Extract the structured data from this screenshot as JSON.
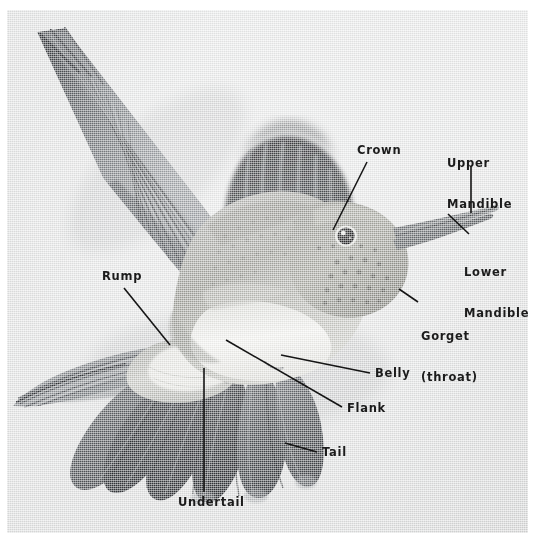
{
  "figure": {
    "kind": "annotated-photograph",
    "rendering": "black-and-white photograph",
    "plate": {
      "x": 7,
      "y": 10,
      "width": 521,
      "height": 523
    },
    "background_color": "#e6e7e7",
    "page_color": "#ffffff",
    "label_color": "#1b1b1b",
    "leader_color": "#151515"
  },
  "labels": [
    {
      "id": "crown",
      "text": "Crown",
      "lines": [
        "Crown"
      ],
      "align": "left",
      "x": 357,
      "y": 144,
      "leader": {
        "from": [
          367,
          162
        ],
        "to": [
          333,
          230
        ]
      }
    },
    {
      "id": "upper-mandible",
      "text": "Upper Mandible",
      "lines": [
        "Upper",
        "Mandible"
      ],
      "align": "left",
      "x": 447,
      "y": 130,
      "leader": {
        "from": [
          471,
          166
        ],
        "to": [
          471,
          213
        ]
      }
    },
    {
      "id": "lower-mandible",
      "text": "Lower Mandible",
      "lines": [
        "Lower",
        "Mandible"
      ],
      "align": "left",
      "x": 464,
      "y": 239,
      "leader": {
        "from": [
          469,
          234
        ],
        "to": [
          448,
          214
        ]
      }
    },
    {
      "id": "gorget-throat",
      "text": "Gorget (throat)",
      "lines": [
        "Gorget",
        "(throat)"
      ],
      "align": "left",
      "x": 421,
      "y": 303,
      "leader": {
        "from": [
          418,
          302
        ],
        "to": [
          399,
          289
        ]
      }
    },
    {
      "id": "belly",
      "text": "Belly",
      "lines": [
        "Belly"
      ],
      "align": "left",
      "x": 375,
      "y": 367,
      "leader": {
        "from": [
          370,
          373
        ],
        "to": [
          281,
          355
        ]
      }
    },
    {
      "id": "flank",
      "text": "Flank",
      "lines": [
        "Flank"
      ],
      "align": "left",
      "x": 347,
      "y": 402,
      "leader": {
        "from": [
          342,
          407
        ],
        "to": [
          226,
          340
        ]
      }
    },
    {
      "id": "tail",
      "text": "Tail",
      "lines": [
        "Tail"
      ],
      "align": "left",
      "x": 322,
      "y": 446,
      "leader": {
        "from": [
          317,
          452
        ],
        "to": [
          285,
          443
        ]
      }
    },
    {
      "id": "undertail",
      "text": "Undertail",
      "lines": [
        "Undertail"
      ],
      "align": "left",
      "x": 178,
      "y": 496,
      "leader": {
        "from": [
          204,
          492
        ],
        "to": [
          204,
          368
        ]
      }
    },
    {
      "id": "rump",
      "text": "Rump",
      "lines": [
        "Rump"
      ],
      "align": "left",
      "x": 102,
      "y": 270,
      "leader": {
        "from": [
          124,
          288
        ],
        "to": [
          170,
          345
        ]
      }
    }
  ],
  "anatomy_terms": [
    "Crown",
    "Upper Mandible",
    "Lower Mandible",
    "Gorget (throat)",
    "Belly",
    "Flank",
    "Tail",
    "Undertail",
    "Rump"
  ]
}
